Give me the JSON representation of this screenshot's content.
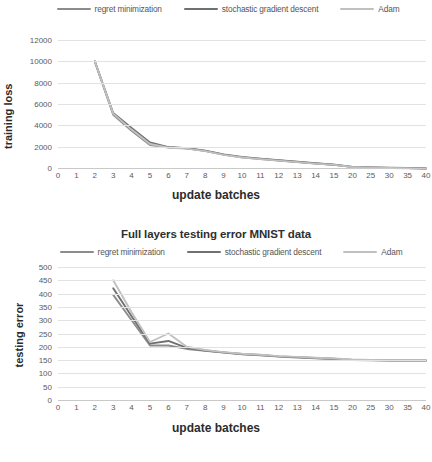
{
  "figure": {
    "width": 432,
    "height": 462
  },
  "colors": {
    "regret_minimization": "#8c8c8c",
    "stochastic_gradient_descent": "#707070",
    "adam": "#c0c0c0",
    "grid": "#e2e2e2",
    "axis": "#c9c9c9",
    "tick_text": "#5a5a5a",
    "title_text": "#2f2f2f"
  },
  "charts": [
    {
      "id": "training-loss",
      "title": "",
      "legend": [
        {
          "label": "regret minimization",
          "color": "#8c8c8c"
        },
        {
          "label": "stochastic gradient descent",
          "color": "#707070"
        },
        {
          "label": "Adam",
          "color": "#c0c0c0"
        }
      ],
      "ylabel": "training loss",
      "xlabel": "update batches",
      "yticks": [
        "0",
        "2000",
        "4000",
        "6000",
        "8000",
        "10000",
        "12000"
      ],
      "xticks": [
        "0",
        "1",
        "2",
        "3",
        "4",
        "5",
        "6",
        "7",
        "8",
        "9",
        "10",
        "11",
        "12",
        "13",
        "14",
        "15",
        "20",
        "25",
        "30",
        "35",
        "40"
      ]
    },
    {
      "id": "testing-error",
      "title": "Full layers testing error MNIST data",
      "legend": [
        {
          "label": "regret minimization",
          "color": "#8c8c8c"
        },
        {
          "label": "stochastic gradient descent",
          "color": "#707070"
        },
        {
          "label": "Adam",
          "color": "#c0c0c0"
        }
      ],
      "ylabel": "testing error",
      "xlabel": "update batches",
      "yticks": [
        "0",
        "50",
        "100",
        "150",
        "200",
        "250",
        "300",
        "350",
        "400",
        "450",
        "500"
      ],
      "xticks": [
        "0",
        "1",
        "2",
        "3",
        "4",
        "5",
        "6",
        "7",
        "8",
        "9",
        "10",
        "11",
        "12",
        "13",
        "14",
        "15",
        "20",
        "25",
        "30",
        "35",
        "40"
      ]
    }
  ],
  "chart_data": [
    {
      "type": "line",
      "title": "",
      "xlabel": "update batches",
      "ylabel": "training loss",
      "categories": [
        "0",
        "1",
        "2",
        "3",
        "4",
        "5",
        "6",
        "7",
        "8",
        "9",
        "10",
        "11",
        "12",
        "13",
        "14",
        "15",
        "20",
        "25",
        "30",
        "35",
        "40"
      ],
      "ylim": [
        0,
        12000
      ],
      "ytick_step": 2000,
      "grid": true,
      "legend_position": "top",
      "series": [
        {
          "name": "regret minimization",
          "color": "#8c8c8c",
          "values": [
            null,
            null,
            10000,
            5000,
            3500,
            2150,
            1950,
            1850,
            1600,
            1250,
            1000,
            850,
            700,
            560,
            420,
            300,
            100,
            40,
            10,
            0,
            -50
          ]
        },
        {
          "name": "stochastic gradient descent",
          "color": "#707070",
          "values": [
            null,
            null,
            10000,
            5150,
            3750,
            2400,
            1950,
            1850,
            1620,
            1280,
            1030,
            880,
            720,
            580,
            440,
            310,
            110,
            50,
            20,
            0,
            -40
          ]
        },
        {
          "name": "Adam",
          "color": "#c0c0c0",
          "values": [
            null,
            null,
            10000,
            5100,
            3600,
            2250,
            1900,
            1820,
            1580,
            1230,
            980,
            830,
            690,
            550,
            410,
            290,
            90,
            30,
            0,
            -20,
            -60
          ]
        }
      ]
    },
    {
      "type": "line",
      "title": "Full layers testing error MNIST data",
      "xlabel": "update batches",
      "ylabel": "testing error",
      "categories": [
        "0",
        "1",
        "2",
        "3",
        "4",
        "5",
        "6",
        "7",
        "8",
        "9",
        "10",
        "11",
        "12",
        "13",
        "14",
        "15",
        "20",
        "25",
        "30",
        "35",
        "40"
      ],
      "ylim": [
        0,
        500
      ],
      "ytick_step": 50,
      "grid": true,
      "legend_position": "top",
      "series": [
        {
          "name": "regret minimization",
          "color": "#8c8c8c",
          "values": [
            null,
            null,
            null,
            395,
            300,
            205,
            205,
            192,
            185,
            178,
            172,
            168,
            163,
            160,
            157,
            154,
            150,
            149,
            148,
            148,
            148
          ]
        },
        {
          "name": "stochastic gradient descent",
          "color": "#707070",
          "values": [
            null,
            null,
            null,
            420,
            315,
            212,
            222,
            196,
            186,
            179,
            173,
            169,
            164,
            161,
            158,
            155,
            151,
            150,
            149,
            149,
            149
          ]
        },
        {
          "name": "Adam",
          "color": "#c0c0c0",
          "values": [
            null,
            null,
            null,
            450,
            330,
            218,
            250,
            200,
            188,
            180,
            174,
            170,
            165,
            162,
            159,
            156,
            152,
            151,
            150,
            150,
            150
          ]
        }
      ]
    }
  ]
}
